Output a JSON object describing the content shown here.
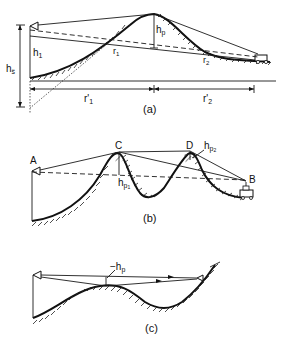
{
  "figure": {
    "panels": [
      {
        "id": "a",
        "caption": "(a)",
        "labels": {
          "h_p": "h",
          "h_p_sub": "p",
          "h1": "h",
          "h1_sub": "1",
          "hs": "h",
          "hs_sub": "s̈",
          "r1": "r",
          "r1_sub": "1",
          "r2": "r",
          "r2_sub": "2",
          "r1prime": "r'",
          "r1prime_sub": "1",
          "r2prime": "r'",
          "r2prime_sub": "2"
        }
      },
      {
        "id": "b",
        "caption": "(b)",
        "labels": {
          "A": "A",
          "B": "B",
          "C": "C",
          "D": "D",
          "hp1": "h",
          "hp1_sub": "p",
          "hp1_subsub": "1",
          "hp2": "h",
          "hp2_sub": "p",
          "hp2_subsub": "2"
        }
      },
      {
        "id": "c",
        "caption": "(c)",
        "labels": {
          "neg_hp": "−h",
          "neg_hp_sub": "p"
        }
      }
    ],
    "icons": [
      "transmitter-antenna-icon",
      "vehicle-receiver-icon"
    ]
  }
}
